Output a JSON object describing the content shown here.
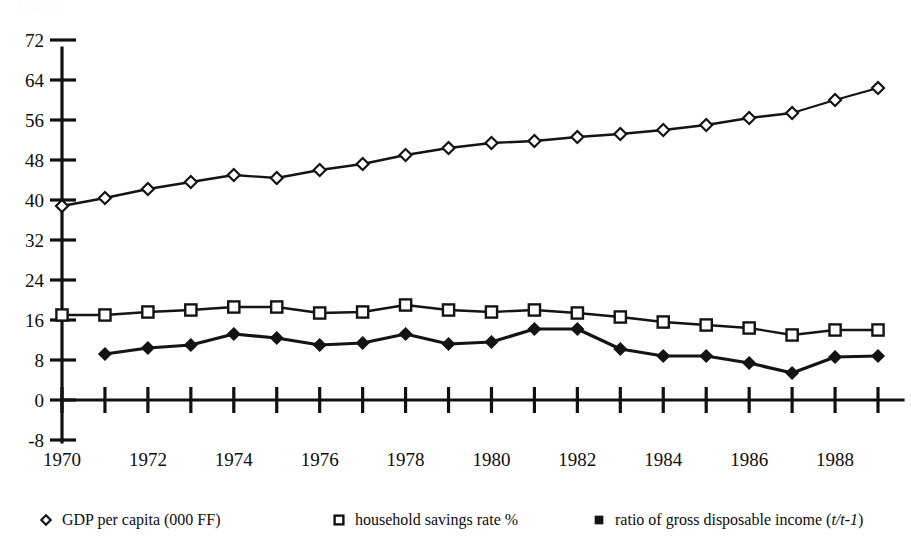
{
  "figure": {
    "background_color": "#ffffff",
    "ink_color": "#141414",
    "partial_top_text": "Figure"
  },
  "chart_data": {
    "type": "line",
    "title": "",
    "subtitle": "",
    "xlabel": "",
    "ylabel": "",
    "x": [
      1970,
      1971,
      1972,
      1973,
      1974,
      1975,
      1976,
      1977,
      1978,
      1979,
      1980,
      1981,
      1982,
      1983,
      1984,
      1985,
      1986,
      1987,
      1988,
      1989
    ],
    "xlim": [
      1970,
      1989
    ],
    "ylim": [
      -8,
      72
    ],
    "yticks": [
      -8,
      0,
      8,
      16,
      24,
      32,
      40,
      48,
      56,
      64,
      72
    ],
    "ytick_labels": [
      "-8",
      "0",
      "8",
      "16",
      "24",
      "32",
      "40",
      "48",
      "56",
      "64",
      "72"
    ],
    "xticks": [
      1970,
      1971,
      1972,
      1973,
      1974,
      1975,
      1976,
      1977,
      1978,
      1979,
      1980,
      1981,
      1982,
      1983,
      1984,
      1985,
      1986,
      1987,
      1988,
      1989
    ],
    "xtick_labels_shown": [
      "1970",
      "1972",
      "1974",
      "1976",
      "1978",
      "1980",
      "1982",
      "1984",
      "1986",
      "1988"
    ],
    "xtick_label_years": [
      1970,
      1972,
      1974,
      1976,
      1978,
      1980,
      1982,
      1984,
      1986,
      1988
    ],
    "grid": false,
    "legend_position": "bottom",
    "series": [
      {
        "name": "GDP per capita (000 FF)",
        "marker": "open-diamond",
        "values": [
          38.8,
          40.4,
          42.2,
          43.6,
          45.0,
          44.4,
          46.0,
          47.2,
          49.0,
          50.4,
          51.4,
          51.8,
          52.6,
          53.2,
          54.0,
          55.0,
          56.4,
          57.4,
          60.0,
          62.4
        ]
      },
      {
        "name": "household savings rate %",
        "marker": "open-square",
        "values": [
          17.0,
          17.0,
          17.6,
          18.0,
          18.6,
          18.6,
          17.4,
          17.6,
          19.0,
          18.0,
          17.6,
          18.0,
          17.4,
          16.6,
          15.6,
          15.0,
          14.4,
          13.0,
          14.0,
          14.0
        ]
      },
      {
        "name": "ratio of gross disposable income (t/t-1)",
        "marker": "filled-diamond",
        "values": [
          null,
          9.2,
          10.4,
          11.0,
          13.2,
          12.4,
          11.0,
          11.4,
          13.2,
          11.2,
          11.6,
          14.2,
          14.2,
          10.2,
          8.8,
          8.8,
          7.4,
          5.4,
          8.6,
          8.8
        ]
      }
    ]
  },
  "legend": {
    "entries": [
      {
        "marker": "open-diamond",
        "label": "GDP per capita (000 FF)"
      },
      {
        "marker": "open-square",
        "label": "household savings rate %"
      },
      {
        "marker": "filled-square",
        "label_prefix": "ratio of gross disposable income (",
        "label_italic": "t/t-1",
        "label_suffix": ")"
      }
    ]
  }
}
